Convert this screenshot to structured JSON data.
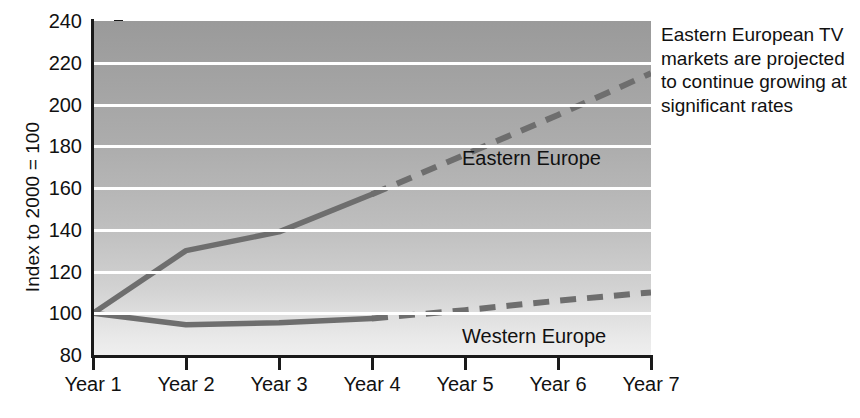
{
  "chart_data": {
    "type": "line",
    "title": "",
    "xlabel": "",
    "ylabel": "Index to 2000 = 100",
    "categories": [
      "Year 1",
      "Year 2",
      "Year 3",
      "Year 4",
      "Year 5",
      "Year 6",
      "Year 7"
    ],
    "ylim": [
      80,
      240
    ],
    "y_ticks": [
      240,
      220,
      200,
      180,
      160,
      140,
      120,
      100,
      80
    ],
    "grid": true,
    "legend_position": "inline-on-plot",
    "series": [
      {
        "name": "Eastern Europe",
        "color": "#6e6e6e",
        "values": [
          100,
          130,
          139,
          157,
          176,
          195,
          215
        ],
        "actual_through": "Year 4",
        "solid_values": [
          100,
          130,
          139,
          157
        ],
        "dashed_values": [
          157,
          176,
          195,
          215
        ]
      },
      {
        "name": "Western Europe",
        "color": "#6e6e6e",
        "values": [
          100,
          94.5,
          95.5,
          97.5,
          101.5,
          106,
          110
        ],
        "actual_through": "Year 4",
        "solid_values": [
          100,
          94.5,
          95.5,
          97.5
        ],
        "dashed_values": [
          97.5,
          101.5,
          106,
          110
        ]
      }
    ],
    "annotations": [
      {
        "name": "eastern-europe-growth-note",
        "text": "Eastern European TV markets are projected to continue growing at significant rates"
      }
    ]
  },
  "axes": {
    "y_title": "Index to 2000 = 100",
    "y_tick_labels": [
      "240",
      "220",
      "200",
      "180",
      "160",
      "140",
      "120",
      "100",
      "80"
    ],
    "x_tick_labels": [
      "Year 1",
      "Year 2",
      "Year 3",
      "Year 4",
      "Year 5",
      "Year 6",
      "Year 7"
    ]
  },
  "series_labels": {
    "eastern": "Eastern Europe",
    "western": "Western Europe"
  },
  "annotation": {
    "text": "Eastern European TV markets are projected to continue growing at significant rates"
  },
  "colors": {
    "line": "#6e6e6e",
    "axis": "#1a1a1a",
    "gridline": "#ffffff",
    "plot_bg_top": "#9a9a9a",
    "plot_bg_bottom": "#efefef",
    "text": "#111111"
  }
}
